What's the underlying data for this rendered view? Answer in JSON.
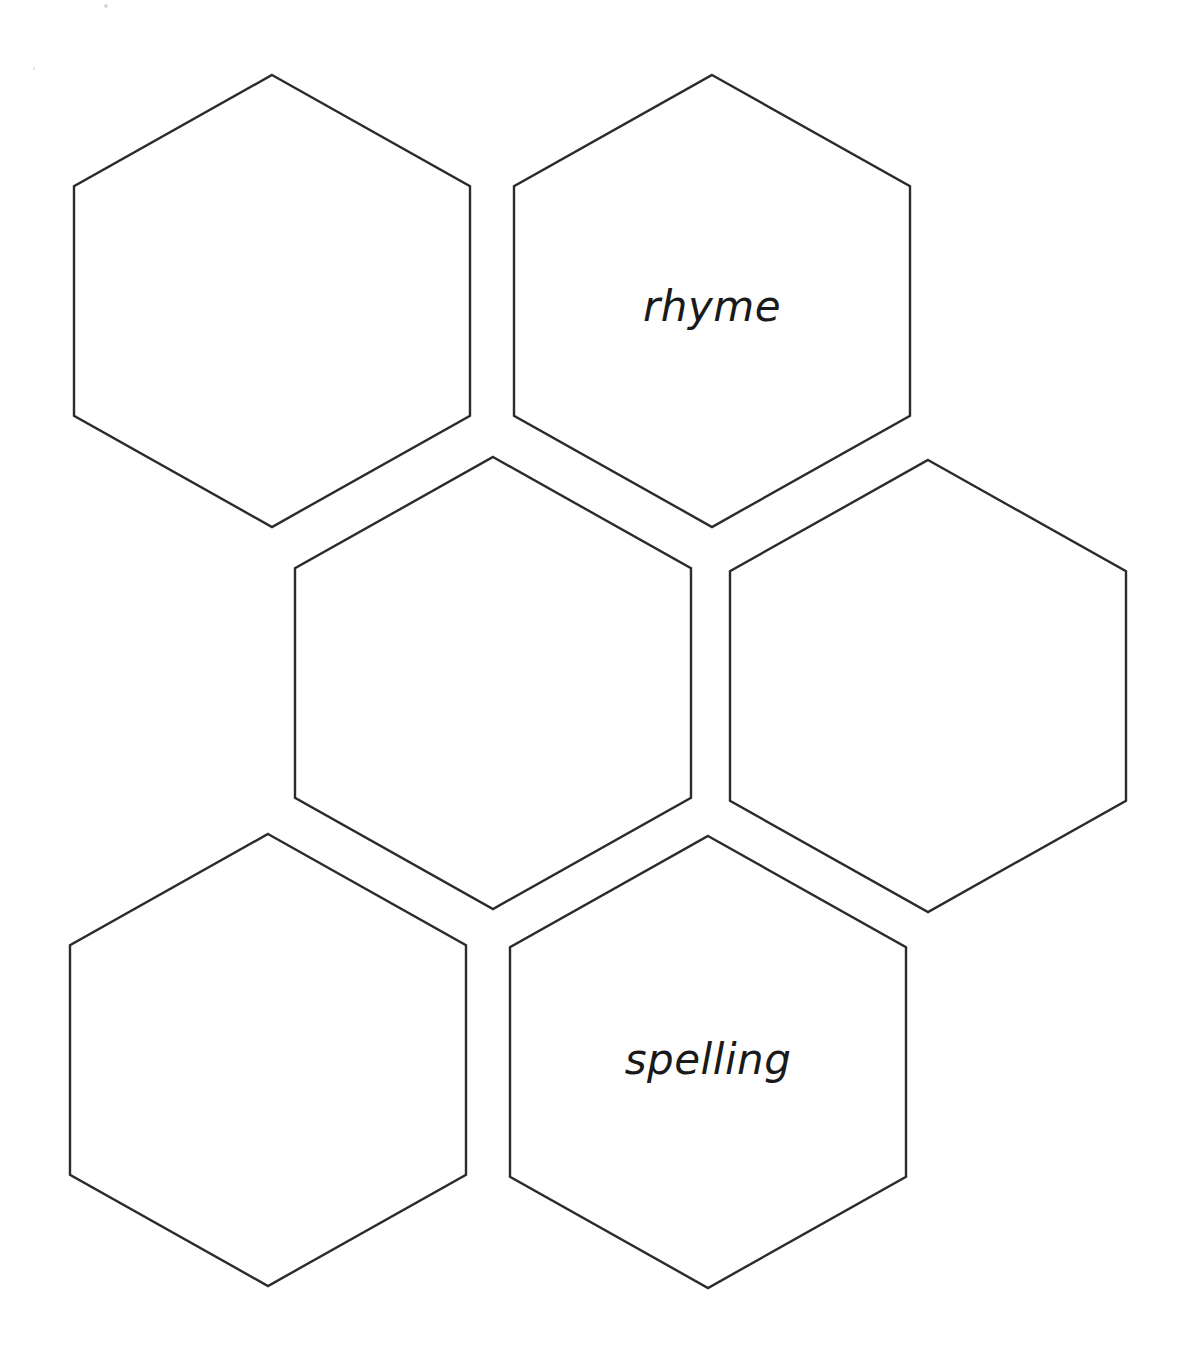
{
  "page": {
    "background_color": "#ffffff",
    "outline_color": "#2b2b2b",
    "width": 1184,
    "height": 1355
  },
  "hexagons": [
    {
      "id": "hex-top-left",
      "label": "",
      "center_x": 272,
      "center_y": 301,
      "width": 396,
      "height": 452,
      "filled": false
    },
    {
      "id": "hex-top-right",
      "label": "rhyme",
      "center_x": 712,
      "center_y": 301,
      "width": 396,
      "height": 452,
      "filled": true
    },
    {
      "id": "hex-middle",
      "label": "",
      "center_x": 493,
      "center_y": 683,
      "width": 396,
      "height": 452,
      "filled": false
    },
    {
      "id": "hex-right",
      "label": "",
      "center_x": 928,
      "center_y": 686,
      "width": 396,
      "height": 452,
      "filled": false
    },
    {
      "id": "hex-bottom-left",
      "label": "",
      "center_x": 268,
      "center_y": 1060,
      "width": 396,
      "height": 452,
      "filled": false
    },
    {
      "id": "hex-bottom-right",
      "label": "spelling",
      "center_x": 708,
      "center_y": 1062,
      "width": 396,
      "height": 452,
      "filled": true
    }
  ],
  "label_offsets": {
    "hex-top-right_dy": 8,
    "hex-bottom-right_dy": 0
  }
}
